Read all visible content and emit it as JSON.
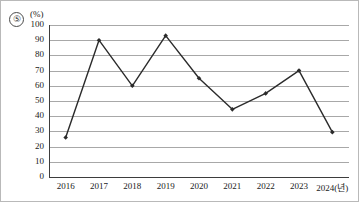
{
  "figure": {
    "choice_marker": "⑤",
    "unit_label": "(%)"
  },
  "chart_data": {
    "type": "line",
    "title": "",
    "xlabel": "",
    "ylabel": "",
    "unit": "(%)",
    "x_axis_suffix": "(년)",
    "categories": [
      "2016",
      "2017",
      "2018",
      "2019",
      "2020",
      "2021",
      "2022",
      "2023",
      "2024"
    ],
    "tick_labels": [
      "2016",
      "2017",
      "2018",
      "2019",
      "2020",
      "2021",
      "2022",
      "2023",
      "2024(년)"
    ],
    "values": [
      26,
      90,
      60,
      93,
      65,
      44.5,
      55,
      70,
      29.5
    ],
    "ylim": [
      0,
      100
    ],
    "ytick_values": [
      0,
      10,
      20,
      30,
      40,
      50,
      60,
      70,
      80,
      90,
      100
    ],
    "ytick_labels": [
      "0",
      "10",
      "20",
      "30",
      "40",
      "50",
      "60",
      "70",
      "80",
      "90",
      "100"
    ],
    "grid": true,
    "legend": null,
    "series": [
      {
        "name": "",
        "values": [
          26,
          90,
          60,
          93,
          65,
          44.5,
          55,
          70,
          29.5
        ],
        "marker": "diamond",
        "color": "#2b2b2b"
      }
    ]
  },
  "colors": {
    "line": "#2b2b2b",
    "marker": "#1a1a1a",
    "gridline": "#a8a8a8",
    "axis": "#3d3d3d",
    "text": "#1a1a1a",
    "frame": "#b9b9b9",
    "background": "#ffffff"
  }
}
